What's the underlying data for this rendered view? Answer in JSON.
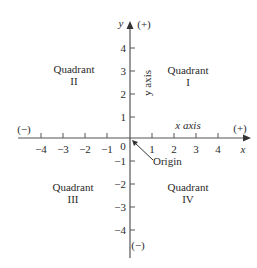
{
  "diagram": {
    "type": "cartesian-coordinate-plane",
    "colors": {
      "axis": "#555555",
      "text": "#2a2a2a",
      "background": "#ffffff"
    },
    "x_axis": {
      "name": "x",
      "label": "x axis",
      "positive_sign": "(+)",
      "negative_sign": "(−)",
      "ticks": [
        "−4",
        "−3",
        "−2",
        "−1",
        "1",
        "2",
        "3",
        "4"
      ]
    },
    "y_axis": {
      "name": "y",
      "label": "y axis",
      "positive_sign": "(+)",
      "negative_sign": "(−)",
      "ticks": [
        "4",
        "3",
        "2",
        "1",
        "−1",
        "−2",
        "−3",
        "−4"
      ]
    },
    "origin": {
      "zero_label": "0",
      "label": "Origin"
    },
    "quadrants": [
      {
        "word": "Quadrant",
        "numeral": "I"
      },
      {
        "word": "Quadrant",
        "numeral": "II"
      },
      {
        "word": "Quadrant",
        "numeral": "III"
      },
      {
        "word": "Quadrant",
        "numeral": "IV"
      }
    ]
  }
}
